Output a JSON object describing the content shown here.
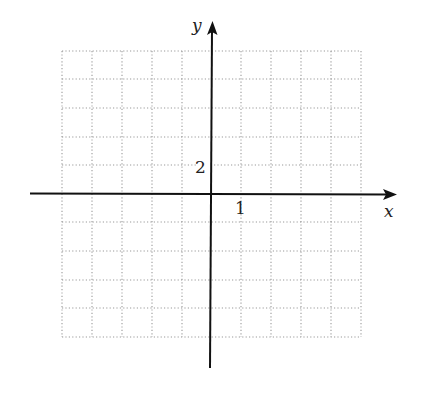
{
  "diagram": {
    "type": "coordinate-plane",
    "axes": {
      "x_label": "x",
      "y_label": "y",
      "x_tick_label": "1",
      "y_tick_label": "2",
      "x_unit_per_grid": 1,
      "y_unit_per_grid": 2
    },
    "grid": {
      "columns": 10,
      "rows": 10,
      "style": "dotted",
      "x_range": [
        -5,
        5
      ],
      "y_range": [
        -10,
        10
      ]
    },
    "colors": {
      "axis": "#111111",
      "grid": "#9a9a9a",
      "background": "#ffffff"
    }
  }
}
